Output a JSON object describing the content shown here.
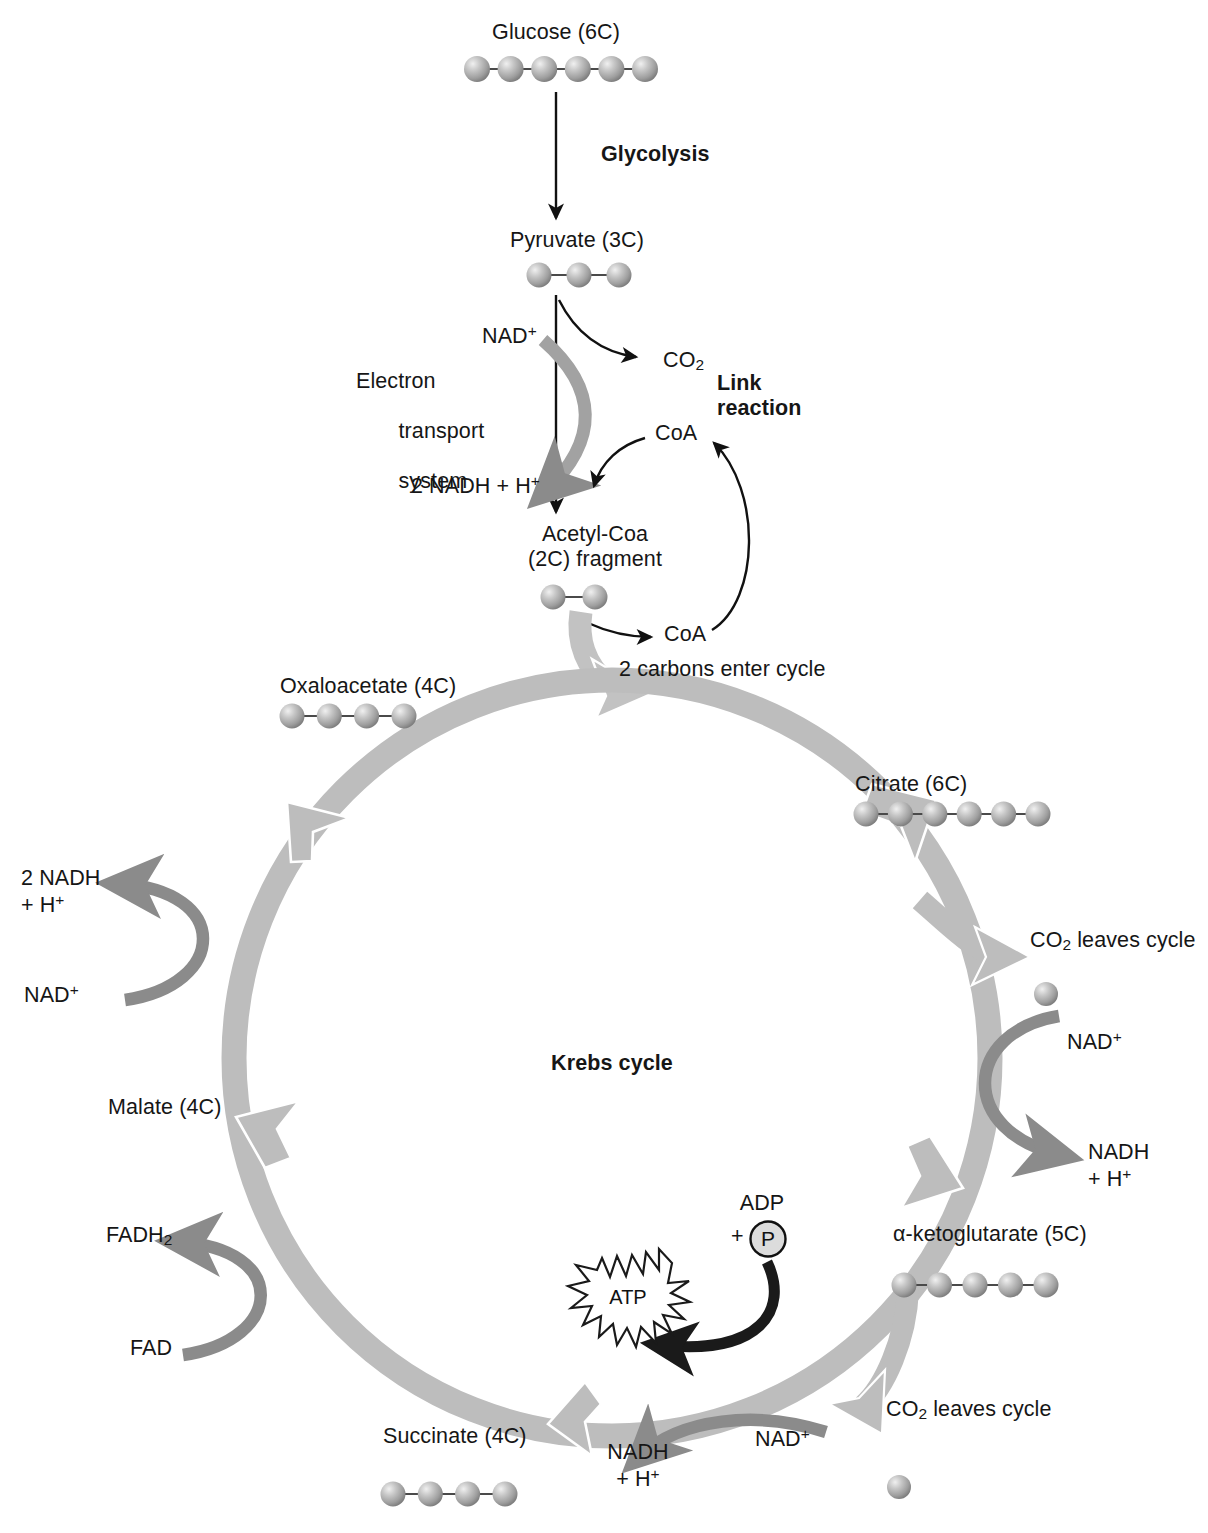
{
  "diagram": {
    "center_label": "Krebs cycle",
    "colors": {
      "ring": "#bdbdbd",
      "ring_edge": "#ffffff",
      "side_arrow": "#8b8b8b",
      "atp_arrow": "#1a1a1a",
      "thin_arrow": "#111111",
      "sphere_fill": "#a9a9a9",
      "sphere_highlight": "#e3e3e3",
      "text": "#161616",
      "background": "#ffffff"
    }
  },
  "glycolysis": {
    "substrate_label": "Glucose (6C)",
    "substrate_carbons": 6,
    "process_label": "Glycolysis",
    "product_label": "Pyruvate (3C)",
    "product_carbons": 3
  },
  "link_reaction": {
    "heading_line1": "Link",
    "heading_line2": "reaction",
    "co2_label": "CO2",
    "co2_label_text": "CO",
    "co2_sub": "2",
    "coa_in_label": "CoA",
    "coa_out_label": "CoA",
    "product_line1": "Acetyl-Coa",
    "product_line2": "(2C) fragment",
    "product_carbons": 2,
    "entry_note": "2 carbons enter cycle"
  },
  "electron_transport": {
    "label_line1": "Electron",
    "label_line2": "transport",
    "label_line3": "system",
    "input_label": "NAD+",
    "input_text": "NAD",
    "input_sup": "+",
    "output_label": "2 NADH + H+",
    "output_text": "2 NADH + H",
    "output_sup": "+"
  },
  "krebs": {
    "center_label": "Krebs cycle",
    "intermediates": [
      {
        "name": "Oxaloacetate (4C)",
        "carbons": 4,
        "position": "upper-left"
      },
      {
        "name": "Citrate (6C)",
        "carbons": 6,
        "position": "upper-right"
      },
      {
        "name": "α-ketoglutarate (5C)",
        "carbons": 5,
        "position": "lower-right"
      },
      {
        "name": "Succinate (4C)",
        "carbons": 4,
        "position": "bottom"
      },
      {
        "name": "Malate (4C)",
        "carbons": 4,
        "position": "lower-left"
      }
    ],
    "left_nadh": {
      "product_line1": "2 NADH",
      "product_line2": "+ H+",
      "product_line2_text": "+ H",
      "product_line2_sup": "+",
      "reactant_text": "NAD",
      "reactant_sup": "+"
    },
    "right_nadh": {
      "reactant_text": "NAD",
      "reactant_sup": "+",
      "product_line1": "NADH",
      "product_line2_text": "+ H",
      "product_line2_sup": "+"
    },
    "bottom_nadh": {
      "reactant_text": "NAD",
      "reactant_sup": "+",
      "product_line1": "NADH",
      "product_line2_text": "+ H",
      "product_line2_sup": "+"
    },
    "fad": {
      "product_text": "FADH",
      "product_sub": "2",
      "reactant_label": "FAD"
    },
    "co2_upper": {
      "text_a": "CO",
      "sub": "2",
      "text_b": " leaves cycle",
      "full": "CO2 leaves cycle"
    },
    "co2_lower": {
      "text_a": "CO",
      "sub": "2",
      "text_b": " leaves cycle",
      "full": "CO2 leaves cycle"
    },
    "atp": {
      "adp_label": "ADP",
      "plus_label": "+",
      "phosphate_label": "P",
      "atp_label": "ATP"
    }
  }
}
